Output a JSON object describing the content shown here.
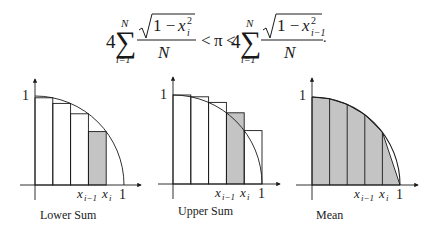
{
  "formula": {
    "coef_left": "4",
    "sum_sym": "∑",
    "upper_limit": "N",
    "lower_limit": "i=1",
    "num_left_one": "1 − ",
    "num_left_var": "x",
    "num_left_sup": "2",
    "num_left_sub": "i",
    "denominator": "N",
    "relation_1": "<",
    "pi": "π",
    "relation_2": "<",
    "coef_right": "4",
    "num_right_one": "1 − ",
    "num_right_var": "x",
    "num_right_sup": "2",
    "num_right_sub": "i−1",
    "end_punct": "."
  },
  "panels": [
    {
      "id": "lower",
      "caption": "Lower Sum",
      "y_tick": "1",
      "x_tick": "1",
      "x_im1_var": "x",
      "x_im1_sub": "i−1",
      "x_i_var": "x",
      "x_i_sub": "i",
      "strips": 5,
      "rule": "right-endpoint",
      "shaded_strip": 4
    },
    {
      "id": "upper",
      "caption": "Upper Sum",
      "y_tick": "1",
      "x_tick": "1",
      "x_im1_var": "x",
      "x_im1_sub": "i−1",
      "x_i_var": "x",
      "x_i_sub": "i",
      "strips": 5,
      "rule": "left-endpoint",
      "shaded_strip": 4
    },
    {
      "id": "mean",
      "caption": "Mean",
      "y_tick": "1",
      "x_tick": "1",
      "x_im1_var": "x",
      "x_im1_sub": "i−1",
      "x_i_var": "x",
      "x_i_sub": "i",
      "strips": 5,
      "rule": "trapezoid",
      "shaded_strip": "all"
    }
  ],
  "colors": {
    "stroke": "#1a1a1a",
    "shade": "#c4c4c4",
    "background": "#ffffff"
  }
}
